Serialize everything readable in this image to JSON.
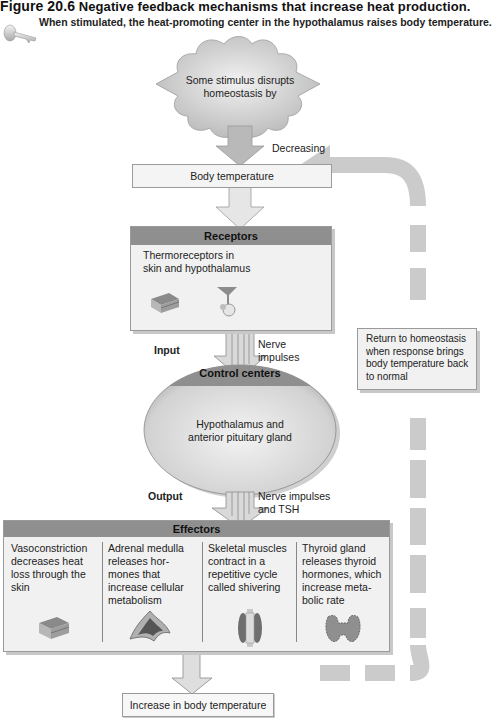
{
  "figure": {
    "title_label": "Figure 20.6",
    "title_text": "Negative feedback mechanisms that increase heat production.",
    "subtitle": "When stimulated, the heat-promoting center in the hypothalamus raises body temperature.",
    "icon": "key-icon"
  },
  "stimulus": {
    "text_line1": "Some stimulus disrupts",
    "text_line2": "homeostasis by",
    "arrow_label": "Decreasing"
  },
  "variable_box": {
    "label": "Body temperature"
  },
  "receptors": {
    "header": "Receptors",
    "text_line1": "Thermoreceptors in",
    "text_line2": "skin and hypothalamus",
    "icons": [
      "skin-section-icon",
      "neuron-icon"
    ]
  },
  "input": {
    "label": "Input",
    "signal_line1": "Nerve",
    "signal_line2": "impulses"
  },
  "control_center": {
    "header": "Control centers",
    "text_line1": "Hypothalamus and",
    "text_line2": "anterior pituitary gland"
  },
  "output": {
    "label": "Output",
    "signal_line1": "Nerve impulses",
    "signal_line2": "and TSH"
  },
  "effectors": {
    "header": "Effectors",
    "items": [
      {
        "lines": [
          "Vasoconstriction",
          "decreases heat",
          "loss through the",
          "skin"
        ],
        "icon": "skin-section-icon"
      },
      {
        "lines": [
          "Adrenal medulla",
          "releases hor-",
          "mones that",
          "increase cellular",
          "metabolism"
        ],
        "icon": "adrenal-gland-icon"
      },
      {
        "lines": [
          "Skeletal muscles",
          "contract in a",
          "repetitive cycle",
          "called shivering"
        ],
        "icon": "muscle-icon"
      },
      {
        "lines": [
          "Thyroid gland",
          "releases thyroid",
          "hormones, which",
          "increase meta-",
          "bolic rate"
        ],
        "icon": "thyroid-gland-icon"
      }
    ]
  },
  "response_box": {
    "label": "Increase in body temperature"
  },
  "return_box": {
    "text_line1": "Return to homeostasis",
    "text_line2": "when response brings",
    "text_line3": "body temperature back",
    "text_line4": "to normal"
  },
  "colors": {
    "header_bar": "#8f8f8f",
    "box_fill": "#f1f1f1",
    "arrow_fill": "#d6d6d6",
    "feedback_loop": "#c9c9c9"
  }
}
